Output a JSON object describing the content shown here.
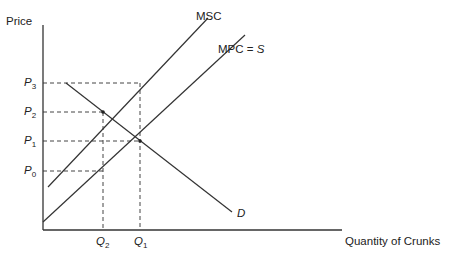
{
  "chart_data": {
    "type": "line",
    "title": "",
    "xlabel": "Quantity of Crunks",
    "ylabel": "Price",
    "grid": false,
    "legend": "inline labels",
    "axis_ticks": {
      "y": [
        {
          "label": "P",
          "sub": "3",
          "y": 83
        },
        {
          "label": "P",
          "sub": "2",
          "y": 112
        },
        {
          "label": "P",
          "sub": "1",
          "y": 141
        },
        {
          "label": "P",
          "sub": "0",
          "y": 171
        }
      ],
      "x": [
        {
          "label": "Q",
          "sub": "2",
          "x": 103
        },
        {
          "label": "Q",
          "sub": "1",
          "x": 140
        }
      ]
    },
    "series": [
      {
        "name": "MSC",
        "label": "MSC",
        "points": [
          [
            48,
            187
          ],
          [
            208,
            18
          ]
        ]
      },
      {
        "name": "MPC = S",
        "label_main": "MPC = ",
        "label_italic": "S",
        "points": [
          [
            43,
            222
          ],
          [
            245,
            35
          ]
        ]
      },
      {
        "name": "D",
        "label": "D",
        "points": [
          [
            66,
            83
          ],
          [
            232,
            212
          ]
        ]
      }
    ],
    "points_of_interest": [
      {
        "name": "MSC∩D",
        "x": 103,
        "y": 112
      },
      {
        "name": "MPC∩D",
        "x": 140,
        "y": 141
      }
    ],
    "guides": [
      {
        "from": [
          43,
          83
        ],
        "to": [
          140,
          83
        ]
      },
      {
        "from": [
          43,
          112
        ],
        "to": [
          103,
          112
        ]
      },
      {
        "from": [
          43,
          141
        ],
        "to": [
          140,
          141
        ]
      },
      {
        "from": [
          43,
          171
        ],
        "to": [
          103,
          171
        ]
      },
      {
        "from": [
          103,
          112
        ],
        "to": [
          103,
          230
        ]
      },
      {
        "from": [
          140,
          83
        ],
        "to": [
          140,
          230
        ]
      }
    ]
  },
  "labels": {
    "y_axis": "Price",
    "x_axis": "Quantity of Crunks",
    "msc": "MSC",
    "mpc_main": "MPC = ",
    "mpc_s": "S",
    "demand": "D",
    "p3": "P",
    "p3_sub": "3",
    "p2": "P",
    "p2_sub": "2",
    "p1": "P",
    "p1_sub": "1",
    "p0": "P",
    "p0_sub": "0",
    "q2": "Q",
    "q2_sub": "2",
    "q1": "Q",
    "q1_sub": "1"
  }
}
